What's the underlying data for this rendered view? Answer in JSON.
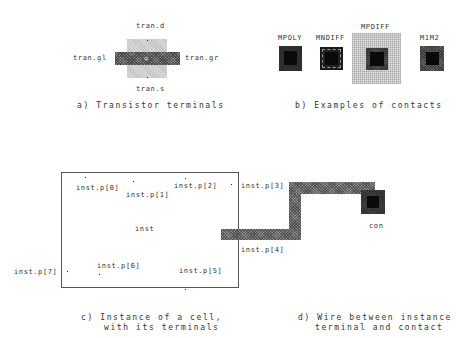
{
  "panel_a": {
    "caption": "a) Transistor terminals",
    "terminals": {
      "d": "tran.d",
      "s": "tran.s",
      "gl": "tran.gl",
      "gr": "tran.gr"
    },
    "colors": {
      "diffusion": "#c4c4c4",
      "poly": "#7a7a7a"
    }
  },
  "panel_b": {
    "caption": "b) Examples of contacts",
    "contacts": [
      {
        "label": "MPOLY"
      },
      {
        "label": "MNDIFF"
      },
      {
        "label": "MPDIFF"
      },
      {
        "label": "M1M2"
      }
    ]
  },
  "panel_c": {
    "caption_line1": "c) Instance of a cell,",
    "caption_line2": "with its terminals",
    "instance_name": "inst",
    "terminals": [
      "inst.p[0]",
      "inst.p[1]",
      "inst.p[2]",
      "inst.p[3]",
      "inst.p[4]",
      "inst.p[5]",
      "inst.p[6]",
      "inst.p[7]"
    ]
  },
  "panel_d": {
    "caption_line1": "d) Wire between instance",
    "caption_line2": "terminal and contact",
    "contact_label": "con"
  }
}
